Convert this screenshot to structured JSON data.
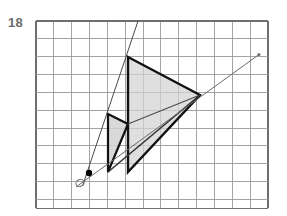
{
  "problem": {
    "number_label": "18",
    "number_color": "#6b6b6b"
  },
  "figure": {
    "title": "Dilation of a triangle from center O on a square grid",
    "background_color": "#ffffff"
  },
  "grid": {
    "name": "square-grid",
    "origin_x": 36,
    "origin_y": 21,
    "cell_size": 17.85,
    "columns": 13,
    "rows": 10.5,
    "line_color": "#9a9a9a",
    "line_width": 0.9,
    "border_color": "#6e6e6e",
    "border_width": 1.3
  },
  "center_of_projection": {
    "name": "center-point-O",
    "label": "O",
    "x": 89,
    "y": 173,
    "dot_radius": 3.2,
    "dot_color": "#000000",
    "label_circle_x": 80,
    "label_circle_y": 183,
    "label_circle_rx": 4.2,
    "label_circle_ry": 3.4,
    "label_color": "#6e6e6e"
  },
  "rays": [
    {
      "name": "ray-steep-through-apex",
      "x1": 82.5,
      "y1": 186,
      "x2": 138,
      "y2": 21,
      "color": "#4a4a4a",
      "width": 1.0
    },
    {
      "name": "ray-shallow-through-right-vertex",
      "x1": 76,
      "y1": 187,
      "x2": 259,
      "y2": 54.5,
      "color": "#6a6a6a",
      "width": 1.0
    }
  ],
  "ray_endpoint": {
    "name": "ray-endpoint-dot",
    "x": 259,
    "y": 54.5,
    "radius": 1.5,
    "color": "#6e6e6e"
  },
  "shapes": [
    {
      "name": "small-triangle-preimage",
      "points": "108,114 128,124 108,172",
      "fill": "#d2d2d2",
      "fill_opacity": 0.85,
      "stroke": "#111111",
      "stroke_width": 2.2
    },
    {
      "name": "large-triangle-image",
      "points": "128,57 200,95 128,172",
      "fill": "#d2d2d2",
      "fill_opacity": 0.72,
      "stroke": "#111111",
      "stroke_width": 2.4
    }
  ],
  "connector_edges": [
    {
      "name": "edge-small-apex-to-large-right-vertex",
      "x1": 128,
      "y1": 124,
      "x2": 200,
      "y2": 95,
      "color": "#4a4a4a",
      "width": 1.1
    },
    {
      "name": "edge-small-bottom-to-large-right-vertex",
      "x1": 108,
      "y1": 172,
      "x2": 200,
      "y2": 95,
      "color": "#333333",
      "width": 1.6
    }
  ]
}
